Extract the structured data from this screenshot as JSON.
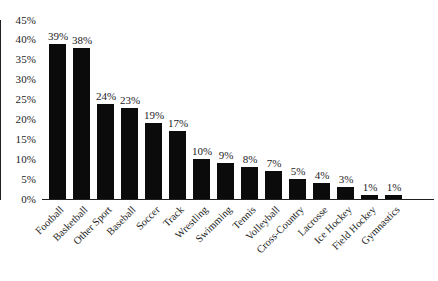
{
  "chart_data": {
    "type": "bar",
    "title": "",
    "subtitle": "",
    "xlabel": "",
    "ylabel": "",
    "ylim": [
      0,
      45
    ],
    "grid": false,
    "legend": null,
    "orientation": "vertical",
    "bar_color": "#0b0b0b",
    "background_color": "#ffffff",
    "y_ticks": [
      "0%",
      "5%",
      "10%",
      "15%",
      "20%",
      "25%",
      "30%",
      "35%",
      "40%",
      "45%"
    ],
    "y_tick_values": [
      0,
      5,
      10,
      15,
      20,
      25,
      30,
      35,
      40,
      45
    ],
    "categories": [
      "Football",
      "Basketball",
      "Other Sport",
      "Baseball",
      "Soccer",
      "Track",
      "Wrestling",
      "Swimming",
      "Tennis",
      "Volleyball",
      "Cross-Country",
      "Lacrosse",
      "Ice Hockey",
      "Field Hockey",
      "Gymnastics"
    ],
    "values": [
      39,
      38,
      24,
      23,
      19,
      17,
      10,
      9,
      8,
      7,
      5,
      4,
      3,
      1,
      1
    ],
    "data_labels": [
      "39%",
      "38%",
      "24%",
      "23%",
      "19%",
      "17%",
      "10%",
      "9%",
      "8%",
      "7%",
      "5%",
      "4%",
      "3%",
      "1%",
      "1%"
    ]
  }
}
